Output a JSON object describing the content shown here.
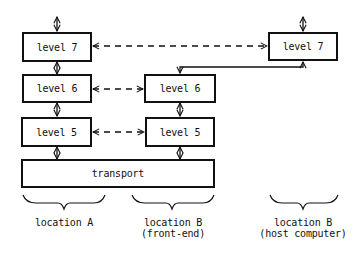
{
  "diagram": {
    "columns": [
      {
        "id": "location-a",
        "label": "location A",
        "sublabel": "",
        "boxes": [
          "level 7",
          "level 6",
          "level 5"
        ]
      },
      {
        "id": "location-b-front-end",
        "label": "location B",
        "sublabel": "(front-end)",
        "boxes": [
          "level 6",
          "level 5"
        ]
      },
      {
        "id": "location-b-host",
        "label": "location B",
        "sublabel": "(host computer)",
        "boxes": [
          "level 7"
        ]
      }
    ],
    "shared": {
      "transport_label": "transport"
    },
    "connections": [
      {
        "from": "location-a/level 7",
        "to": "location-b-host/level 7",
        "style": "dashed",
        "bidirectional": true
      },
      {
        "from": "location-a/level 6",
        "to": "location-b-front-end/level 6",
        "style": "dashed",
        "bidirectional": true
      },
      {
        "from": "location-a/level 5",
        "to": "location-b-front-end/level 5",
        "style": "dashed",
        "bidirectional": true
      },
      {
        "from": "location-b-host/level 7",
        "to": "location-b-front-end/level 6",
        "style": "solid",
        "bidirectional": true
      },
      {
        "from": "location-a/level 7",
        "to": "location-a/level 6",
        "style": "solid",
        "bidirectional": true
      },
      {
        "from": "location-a/level 6",
        "to": "location-a/level 5",
        "style": "solid",
        "bidirectional": true
      },
      {
        "from": "location-a/level 5",
        "to": "transport",
        "style": "solid",
        "bidirectional": true
      },
      {
        "from": "location-b-front-end/level 6",
        "to": "location-b-front-end/level 5",
        "style": "solid",
        "bidirectional": true
      },
      {
        "from": "location-b-front-end/level 5",
        "to": "transport",
        "style": "solid",
        "bidirectional": true
      }
    ]
  }
}
